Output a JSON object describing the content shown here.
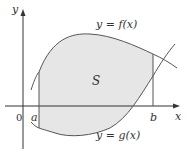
{
  "figure": {
    "axes": {
      "x_label": "x",
      "y_label": "y",
      "origin_label": "0"
    },
    "bounds": {
      "a_label": "a",
      "b_label": "b"
    },
    "curves": {
      "upper_label": "y = f(x)",
      "lower_label": "y = g(x)"
    },
    "region": {
      "label": "S",
      "fill_color": "#e6e6e6"
    },
    "colors": {
      "line": "#555555",
      "axis": "#333333"
    }
  }
}
